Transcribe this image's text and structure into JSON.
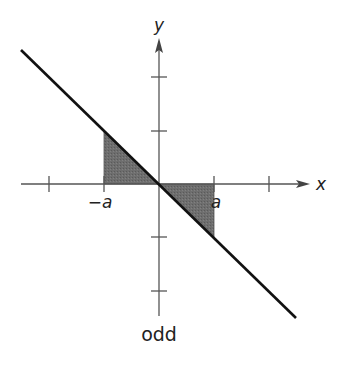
{
  "diagram": {
    "caption": "odd",
    "axes": {
      "x_label": "x",
      "y_label": "y"
    },
    "tick_labels": {
      "neg_a": "−a",
      "pos_a": "a"
    },
    "function": "odd function, line through origin with negative slope",
    "shaded_regions": [
      {
        "from": "-a",
        "to": "0",
        "side": "above x-axis"
      },
      {
        "from": "0",
        "to": "a",
        "side": "below x-axis"
      }
    ],
    "colors": {
      "line": "#111111",
      "axes": "#555555",
      "shade": "#6b6b6b",
      "background": "#ffffff"
    }
  }
}
